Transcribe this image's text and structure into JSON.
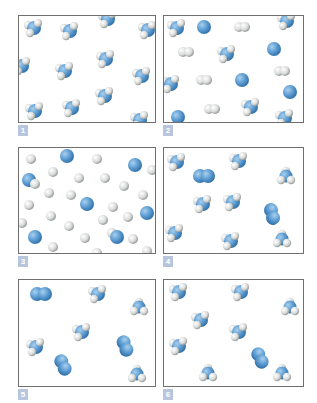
{
  "colors": {
    "nitrogen": "#5b9bd1",
    "nitrogen_dark": "#2f6fa6",
    "hydrogen": "#d9dcda",
    "hydrogen_dark": "#8e9490",
    "border": "#6f6f6f",
    "label_bg": "#b7c6dc"
  },
  "panels": [
    {
      "label": "1",
      "box": {
        "x": 18,
        "y": 15,
        "w": 138,
        "h": 108
      },
      "molecules": [
        {
          "type": "NH3",
          "x": 14,
          "y": 12
        },
        {
          "type": "NH3",
          "x": 50,
          "y": 15
        },
        {
          "type": "NH3",
          "x": 88,
          "y": 3
        },
        {
          "type": "NH3",
          "x": 128,
          "y": 14
        },
        {
          "type": "NH3",
          "x": 2,
          "y": 50
        },
        {
          "type": "NH3",
          "x": 45,
          "y": 55
        },
        {
          "type": "NH3",
          "x": 86,
          "y": 43
        },
        {
          "type": "NH3",
          "x": 122,
          "y": 60
        },
        {
          "type": "NH3",
          "x": 85,
          "y": 80
        },
        {
          "type": "NH3",
          "x": 15,
          "y": 95
        },
        {
          "type": "NH3",
          "x": 52,
          "y": 92
        },
        {
          "type": "NH3",
          "x": 120,
          "y": 104
        }
      ]
    },
    {
      "label": "2",
      "box": {
        "x": 163,
        "y": 15,
        "w": 141,
        "h": 108
      },
      "molecules": [
        {
          "type": "NH3",
          "x": 12,
          "y": 12
        },
        {
          "type": "N",
          "x": 40,
          "y": 11
        },
        {
          "type": "H2",
          "x": 78,
          "y": 11
        },
        {
          "type": "NH3",
          "x": 122,
          "y": 5
        },
        {
          "type": "H2",
          "x": 22,
          "y": 36
        },
        {
          "type": "NH3",
          "x": 62,
          "y": 38
        },
        {
          "type": "N",
          "x": 110,
          "y": 33
        },
        {
          "type": "H2",
          "x": 118,
          "y": 55
        },
        {
          "type": "NH3",
          "x": 6,
          "y": 68
        },
        {
          "type": "H2",
          "x": 40,
          "y": 64
        },
        {
          "type": "N",
          "x": 78,
          "y": 64
        },
        {
          "type": "N",
          "x": 126,
          "y": 76
        },
        {
          "type": "H2",
          "x": 48,
          "y": 93
        },
        {
          "type": "NH3",
          "x": 86,
          "y": 91
        },
        {
          "type": "N",
          "x": 14,
          "y": 101
        },
        {
          "type": "NH3",
          "x": 120,
          "y": 102
        }
      ]
    },
    {
      "label": "3",
      "box": {
        "x": 18,
        "y": 147,
        "w": 138,
        "h": 107
      },
      "molecules": [
        {
          "type": "H",
          "x": 12,
          "y": 11
        },
        {
          "type": "N",
          "x": 48,
          "y": 8
        },
        {
          "type": "H",
          "x": 78,
          "y": 11
        },
        {
          "type": "N",
          "x": 116,
          "y": 17
        },
        {
          "type": "H",
          "x": 133,
          "y": 22
        },
        {
          "type": "H",
          "x": 34,
          "y": 24
        },
        {
          "type": "N",
          "x": 10,
          "y": 32
        },
        {
          "type": "H",
          "x": 16,
          "y": 36
        },
        {
          "type": "H",
          "x": 60,
          "y": 30
        },
        {
          "type": "H",
          "x": 86,
          "y": 30
        },
        {
          "type": "H",
          "x": 105,
          "y": 38
        },
        {
          "type": "H",
          "x": 30,
          "y": 45
        },
        {
          "type": "H",
          "x": 52,
          "y": 47
        },
        {
          "type": "H",
          "x": 124,
          "y": 47
        },
        {
          "type": "H",
          "x": 10,
          "y": 57
        },
        {
          "type": "N",
          "x": 68,
          "y": 56
        },
        {
          "type": "H",
          "x": 94,
          "y": 59
        },
        {
          "type": "H",
          "x": 32,
          "y": 68
        },
        {
          "type": "H",
          "x": 84,
          "y": 72
        },
        {
          "type": "H",
          "x": 109,
          "y": 69
        },
        {
          "type": "N",
          "x": 128,
          "y": 65
        },
        {
          "type": "H",
          "x": 3,
          "y": 75
        },
        {
          "type": "H",
          "x": 50,
          "y": 78
        },
        {
          "type": "H",
          "x": 93,
          "y": 85
        },
        {
          "type": "N",
          "x": 98,
          "y": 89
        },
        {
          "type": "N",
          "x": 16,
          "y": 89
        },
        {
          "type": "H",
          "x": 66,
          "y": 90
        },
        {
          "type": "H",
          "x": 114,
          "y": 91
        },
        {
          "type": "H",
          "x": 34,
          "y": 99
        },
        {
          "type": "H",
          "x": 78,
          "y": 105
        },
        {
          "type": "H",
          "x": 128,
          "y": 103
        }
      ]
    },
    {
      "label": "4",
      "box": {
        "x": 163,
        "y": 147,
        "w": 141,
        "h": 107
      },
      "molecules": [
        {
          "type": "NH3",
          "x": 12,
          "y": 14
        },
        {
          "type": "N2",
          "x": 40,
          "y": 28,
          "angle": 0
        },
        {
          "type": "NH3",
          "x": 74,
          "y": 13
        },
        {
          "type": "NH3tri",
          "x": 122,
          "y": 28
        },
        {
          "type": "NH3",
          "x": 38,
          "y": 56
        },
        {
          "type": "NH3",
          "x": 68,
          "y": 54
        },
        {
          "type": "N2",
          "x": 108,
          "y": 66,
          "angle": 75
        },
        {
          "type": "NH3",
          "x": 10,
          "y": 85
        },
        {
          "type": "NH3",
          "x": 66,
          "y": 93
        },
        {
          "type": "NH3tri",
          "x": 118,
          "y": 91
        }
      ]
    },
    {
      "label": "5",
      "box": {
        "x": 18,
        "y": 279,
        "w": 138,
        "h": 108
      },
      "molecules": [
        {
          "type": "N2",
          "x": 22,
          "y": 14,
          "angle": 0
        },
        {
          "type": "NH3",
          "x": 78,
          "y": 14
        },
        {
          "type": "NH3tri",
          "x": 120,
          "y": 27
        },
        {
          "type": "NH3",
          "x": 62,
          "y": 52
        },
        {
          "type": "NH3",
          "x": 16,
          "y": 67
        },
        {
          "type": "N2",
          "x": 106,
          "y": 66,
          "angle": 70
        },
        {
          "type": "N2",
          "x": 44,
          "y": 85,
          "angle": 65
        },
        {
          "type": "NH3tri",
          "x": 118,
          "y": 94
        }
      ]
    },
    {
      "label": "6",
      "box": {
        "x": 163,
        "y": 279,
        "w": 141,
        "h": 108
      },
      "molecules": [
        {
          "type": "NH3",
          "x": 14,
          "y": 12
        },
        {
          "type": "NH3",
          "x": 76,
          "y": 12
        },
        {
          "type": "NH3tri",
          "x": 126,
          "y": 27
        },
        {
          "type": "NH3",
          "x": 36,
          "y": 40
        },
        {
          "type": "NH3",
          "x": 74,
          "y": 52
        },
        {
          "type": "NH3",
          "x": 14,
          "y": 66
        },
        {
          "type": "N2",
          "x": 96,
          "y": 78,
          "angle": 65
        },
        {
          "type": "NH3tri",
          "x": 44,
          "y": 93
        },
        {
          "type": "NH3tri",
          "x": 118,
          "y": 93
        }
      ]
    }
  ]
}
